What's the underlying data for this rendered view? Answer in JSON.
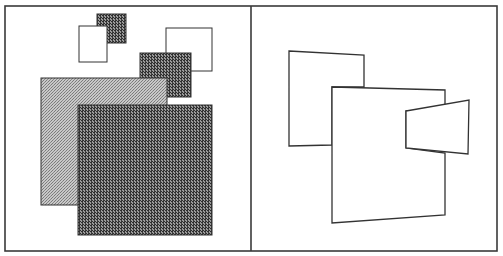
{
  "figure": {
    "width": 503,
    "height": 256,
    "frame": {
      "x": 5,
      "y": 6,
      "width": 492,
      "height": 245,
      "divider_x": 251,
      "stroke": "#3a3a3a"
    },
    "colors": {
      "light_pattern_bg": "#c8c8c8",
      "light_pattern_dot": "#7a7a7a",
      "dark_pattern_bg": "#9a9a9a",
      "dark_pattern_dot": "#2e2e2e",
      "outline": "#333333",
      "white": "#ffffff"
    },
    "left_panel": {
      "label": "textured-squares",
      "shapes": [
        {
          "id": "dark-small-top",
          "fill": "dark",
          "x": 97,
          "y": 14,
          "w": 29,
          "h": 29
        },
        {
          "id": "white-small-left",
          "fill": "white",
          "x": 79,
          "y": 26,
          "w": 28,
          "h": 36
        },
        {
          "id": "white-right",
          "fill": "white",
          "x": 166,
          "y": 28,
          "w": 46,
          "h": 43
        },
        {
          "id": "dark-medium",
          "fill": "dark",
          "x": 140,
          "y": 53,
          "w": 51,
          "h": 44
        },
        {
          "id": "light-large",
          "fill": "light",
          "x": 41,
          "y": 78,
          "w": 126,
          "h": 127
        },
        {
          "id": "dark-large",
          "fill": "dark",
          "x": 78,
          "y": 105,
          "w": 134,
          "h": 130
        }
      ]
    },
    "right_panel": {
      "label": "outlined-quadrilaterals",
      "shapes": [
        {
          "id": "back-quad",
          "points": "289,51 364,55 364,87 332,87 332,145 289,146"
        },
        {
          "id": "main-quad",
          "points": "332,87 445,90 445,110 406,111 406,148 445,153 445,215 332,223"
        },
        {
          "id": "small-trapezoid",
          "points": "406,111 469,100 468,154 406,148"
        }
      ]
    }
  }
}
